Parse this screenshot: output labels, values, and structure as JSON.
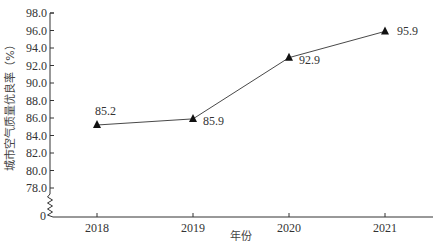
{
  "chart_data": {
    "type": "line",
    "title": "",
    "xlabel": "年份",
    "ylabel": "城市空气质量优良率（%）",
    "categories": [
      "2018",
      "2019",
      "2020",
      "2021"
    ],
    "series": [
      {
        "name": "城市空气质量优良率",
        "values": [
          85.2,
          85.9,
          92.9,
          95.9
        ],
        "marker": "triangle"
      }
    ],
    "ylim": [
      78.0,
      98.0
    ],
    "y_ticks": [
      "98.0",
      "96.0",
      "94.0",
      "92.0",
      "90.0",
      "88.0",
      "86.0",
      "84.0",
      "82.0",
      "80.0",
      "78.0"
    ],
    "y_axis_break": true,
    "y_origin_label": "0",
    "data_labels": [
      "85.2",
      "85.9",
      "92.9",
      "95.9"
    ],
    "grid": false,
    "legend": "none"
  }
}
